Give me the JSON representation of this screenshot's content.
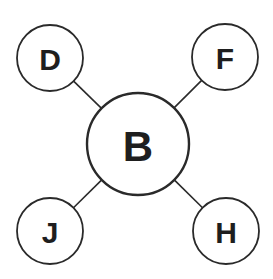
{
  "diagram": {
    "type": "hub-and-spoke",
    "center": {
      "id": "B",
      "label": "B",
      "cx": 138,
      "cy": 144,
      "r": 51
    },
    "nodes": [
      {
        "id": "D",
        "label": "D",
        "cx": 50,
        "cy": 58,
        "r": 33
      },
      {
        "id": "F",
        "label": "F",
        "cx": 225,
        "cy": 57,
        "r": 33
      },
      {
        "id": "J",
        "label": "J",
        "cx": 50,
        "cy": 231,
        "r": 33
      },
      {
        "id": "H",
        "label": "H",
        "cx": 226,
        "cy": 231,
        "r": 33
      }
    ],
    "edges": [
      {
        "from": "B",
        "to": "D"
      },
      {
        "from": "B",
        "to": "F"
      },
      {
        "from": "B",
        "to": "J"
      },
      {
        "from": "B",
        "to": "H"
      }
    ],
    "colors": {
      "stroke": "#2a2a2a",
      "fill": "#ffffff",
      "text": "#1e1e1e"
    }
  }
}
